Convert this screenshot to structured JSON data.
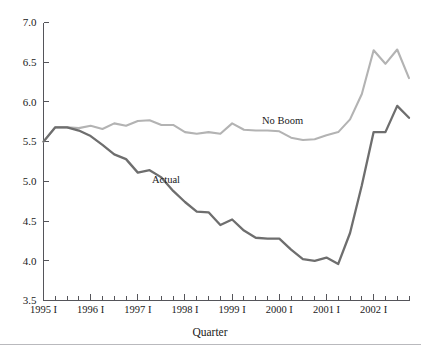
{
  "chart_data": {
    "type": "line",
    "title": "",
    "xlabel": "Quarter",
    "ylabel": "",
    "ylim": [
      3.5,
      7.0
    ],
    "ytick_step": 0.5,
    "yticks": [
      "3.5",
      "4.0",
      "4.5",
      "5.0",
      "5.5",
      "6.0",
      "6.5",
      "7.0"
    ],
    "grid": false,
    "legend_position": "inline-annotation",
    "x": [
      "1995 I",
      "1995 II",
      "1995 III",
      "1995 IV",
      "1996 I",
      "1996 II",
      "1996 III",
      "1996 IV",
      "1997 I",
      "1997 II",
      "1997 III",
      "1997 IV",
      "1998 I",
      "1998 II",
      "1998 III",
      "1998 IV",
      "1999 I",
      "1999 II",
      "1999 III",
      "1999 IV",
      "2000 I",
      "2000 II",
      "2000 III",
      "2000 IV",
      "2001 I",
      "2001 II",
      "2001 III",
      "2001 IV",
      "2002 I",
      "2002 II",
      "2002 III",
      "2002 IV"
    ],
    "xtick_labels": [
      "1995 I",
      "1996 I",
      "1997 I",
      "1998 I",
      "1999 I",
      "2000 I",
      "2001 I",
      "2002 I"
    ],
    "xtick_label_every": 4,
    "series": [
      {
        "name": "No Boom",
        "color": "#b3b3b3",
        "values": [
          5.5,
          5.68,
          5.68,
          5.67,
          5.7,
          5.66,
          5.73,
          5.7,
          5.76,
          5.77,
          5.71,
          5.71,
          5.62,
          5.6,
          5.62,
          5.6,
          5.73,
          5.65,
          5.64,
          5.64,
          5.63,
          5.55,
          5.52,
          5.53,
          5.58,
          5.62,
          5.78,
          6.1,
          6.65,
          6.48,
          6.66,
          6.3
        ]
      },
      {
        "name": "Actual",
        "color": "#6e6e6e",
        "values": [
          5.5,
          5.68,
          5.68,
          5.64,
          5.57,
          5.46,
          5.34,
          5.28,
          5.11,
          5.14,
          5.05,
          4.88,
          4.74,
          4.62,
          4.61,
          4.45,
          4.52,
          4.38,
          4.29,
          4.28,
          4.28,
          4.14,
          4.02,
          4.0,
          4.04,
          3.96,
          4.35,
          4.95,
          5.62,
          5.62,
          5.95,
          5.8
        ]
      }
    ],
    "annotations": [
      {
        "text": "No Boom",
        "x_px": 262,
        "y_px": 124
      },
      {
        "text": "Actual",
        "x_px": 152,
        "y_px": 183
      }
    ]
  },
  "figure": {
    "axis_color": "#55555a",
    "background": "#ffffff",
    "rule_color": "#b9b9bd"
  }
}
